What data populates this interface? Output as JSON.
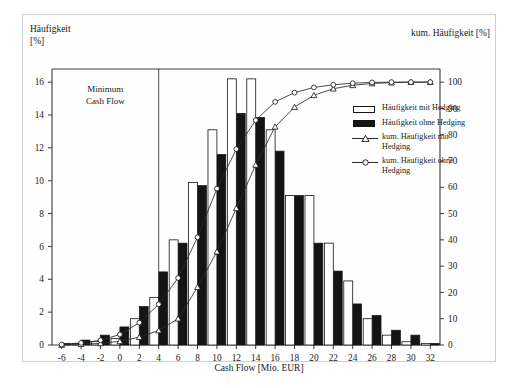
{
  "figure": {
    "y_axis_left_title": "Häufigkeit\n[%]",
    "y_axis_right_title": "kum. Häufigkeit [%]",
    "x_axis_title": "Cash Flow [Mio. EUR]",
    "annotation": "Minimum\nCash Flow",
    "annotation_line_value": 4
  },
  "legend": {
    "position": "inside-top-right",
    "items": [
      {
        "key": "swatch-white",
        "label": "Häufigkeit mit Hedging"
      },
      {
        "key": "swatch-black",
        "label": "Häufigkeit ohne Hedging"
      },
      {
        "key": "line-triangle",
        "label": "kum. Häufigkeit mit Hedging"
      },
      {
        "key": "line-circle",
        "label": "kum. Häufigkeit ohne Hedging"
      }
    ]
  },
  "colors": {
    "bar_mit_hedging": "#ffffff",
    "bar_ohne_hedging": "#141414",
    "bar_outline": "#141414",
    "curve": "#2a2a2a",
    "axis": "#3a3a3a",
    "frame": "#cfcfcf",
    "background": "#ffffff"
  },
  "chart_data": {
    "type": "bar",
    "title": "",
    "xlabel": "Cash Flow [Mio. EUR]",
    "ylabel": "Häufigkeit [%]",
    "y2label": "kum. Häufigkeit [%]",
    "xlim": [
      -7,
      33
    ],
    "ylim": [
      0,
      16.8
    ],
    "y2lim": [
      0,
      105
    ],
    "grid": false,
    "x": [
      -6,
      -4,
      -2,
      0,
      2,
      4,
      6,
      8,
      10,
      12,
      14,
      16,
      18,
      20,
      22,
      24,
      26,
      28,
      30,
      32
    ],
    "xticks": [
      -6,
      -4,
      -2,
      0,
      2,
      4,
      6,
      8,
      10,
      12,
      14,
      16,
      18,
      20,
      22,
      24,
      26,
      28,
      30,
      32
    ],
    "yticks": [
      0,
      2,
      4,
      6,
      8,
      10,
      12,
      14,
      16
    ],
    "y2ticks": [
      0,
      10,
      20,
      30,
      40,
      50,
      60,
      70,
      80,
      90,
      100
    ],
    "series": [
      {
        "name": "Häufigkeit mit Hedging",
        "kind": "bar",
        "axis": "left",
        "fill": "#ffffff",
        "values": [
          0.0,
          0.1,
          0.2,
          0.4,
          1.6,
          2.9,
          6.4,
          9.9,
          13.1,
          16.2,
          16.2,
          13.1,
          9.1,
          9.1,
          6.2,
          3.9,
          1.6,
          0.6,
          0.2,
          0.1
        ]
      },
      {
        "name": "Häufigkeit ohne Hedging",
        "kind": "bar",
        "axis": "left",
        "fill": "#141414",
        "values": [
          0.1,
          0.3,
          0.6,
          1.1,
          2.35,
          4.45,
          6.2,
          9.7,
          11.6,
          14.1,
          13.85,
          11.8,
          9.1,
          6.2,
          4.5,
          2.5,
          1.8,
          0.9,
          0.6,
          0.1
        ]
      },
      {
        "name": "kum. Häufigkeit mit Hedging",
        "kind": "line",
        "marker": "triangle",
        "axis": "right",
        "values": [
          0.0,
          0.3,
          0.6,
          1.4,
          3.0,
          5.5,
          10.0,
          22.0,
          35.5,
          52.0,
          68.5,
          83.0,
          90.5,
          95.0,
          97.5,
          98.8,
          99.5,
          99.8,
          100.0,
          100.0
        ]
      },
      {
        "name": "kum. Häufigkeit ohne Hedging",
        "kind": "line",
        "marker": "circle",
        "axis": "right",
        "values": [
          0.2,
          0.8,
          1.8,
          4.0,
          8.5,
          15.5,
          25.5,
          41.0,
          59.5,
          74.5,
          85.5,
          92.5,
          96.0,
          98.0,
          99.0,
          99.6,
          99.9,
          100.0,
          100.0,
          100.0
        ]
      }
    ]
  }
}
